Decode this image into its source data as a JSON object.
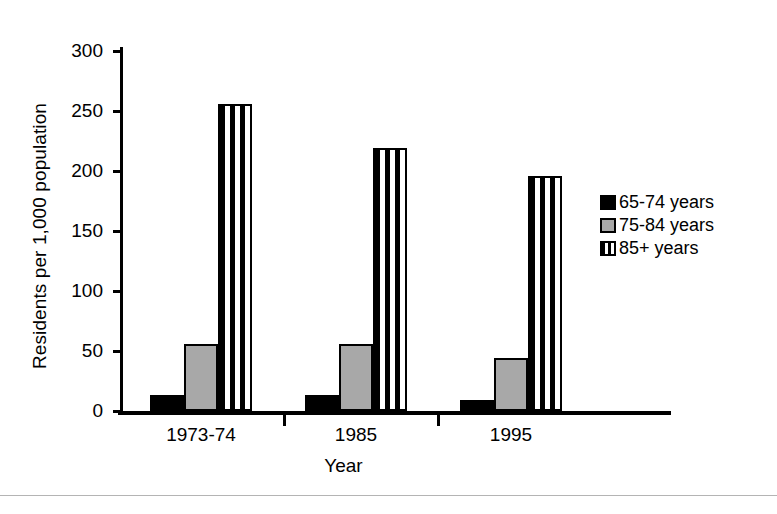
{
  "chart_data": {
    "type": "bar",
    "title": "",
    "xlabel": "Year",
    "ylabel": "Residents per 1,000 population",
    "categories": [
      "1973-74",
      "1985",
      "1995"
    ],
    "series": [
      {
        "name": "65-74 years",
        "color": "#000000",
        "pattern": "solid-black",
        "values": [
          13,
          13,
          9
        ]
      },
      {
        "name": "75-84 years",
        "color": "#a8a8a8",
        "pattern": "solid-gray",
        "values": [
          56,
          56,
          44
        ]
      },
      {
        "name": "85+ years",
        "color": "#000000",
        "pattern": "vertical-stripes",
        "values": [
          256,
          219,
          196
        ]
      }
    ],
    "ylim": [
      0,
      300
    ],
    "yticks": [
      0,
      50,
      100,
      150,
      200,
      250,
      300
    ],
    "ytick_labels": [
      "0",
      "50",
      "100",
      "150",
      "200",
      "250",
      "300"
    ],
    "grid": false,
    "legend_position": "right"
  },
  "axes": {
    "y_title": "Residents per 1,000 population",
    "x_title": "Year"
  },
  "legend": {
    "items": [
      {
        "label": "65-74 years"
      },
      {
        "label": "75-84 years"
      },
      {
        "label": "85+ years"
      }
    ]
  }
}
